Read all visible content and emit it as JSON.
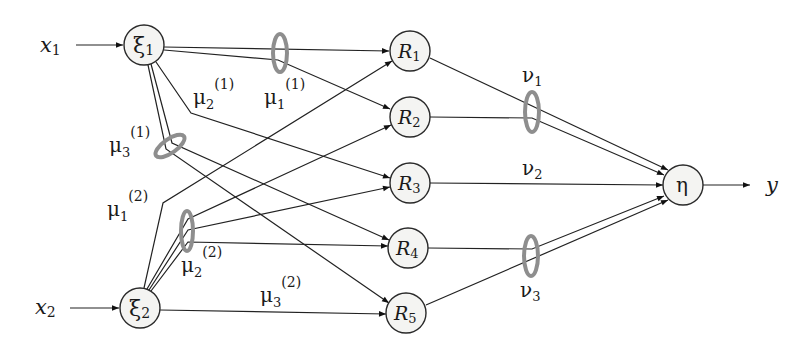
{
  "diagram": {
    "inputs": [
      {
        "id": "x1",
        "label": "x",
        "sub": "1"
      },
      {
        "id": "x2",
        "label": "x",
        "sub": "2"
      }
    ],
    "fuzzifiers": [
      {
        "id": "xi1",
        "label": "ξ",
        "sub": "1"
      },
      {
        "id": "xi2",
        "label": "ξ",
        "sub": "2"
      }
    ],
    "rules": [
      {
        "id": "R1",
        "label": "R",
        "sub": "1"
      },
      {
        "id": "R2",
        "label": "R",
        "sub": "2"
      },
      {
        "id": "R3",
        "label": "R",
        "sub": "3"
      },
      {
        "id": "R4",
        "label": "R",
        "sub": "4"
      },
      {
        "id": "R5",
        "label": "R",
        "sub": "5"
      }
    ],
    "output_node": {
      "id": "eta",
      "label": "η"
    },
    "output": {
      "label": "y"
    },
    "membership_labels": [
      {
        "id": "mu1_1",
        "label": "μ",
        "sub": "1",
        "sup": "(1)"
      },
      {
        "id": "mu2_1",
        "label": "μ",
        "sub": "2",
        "sup": "(1)"
      },
      {
        "id": "mu3_1",
        "label": "μ",
        "sub": "3",
        "sup": "(1)"
      },
      {
        "id": "mu1_2",
        "label": "μ",
        "sub": "1",
        "sup": "(2)"
      },
      {
        "id": "mu2_2",
        "label": "μ",
        "sub": "2",
        "sup": "(2)"
      },
      {
        "id": "mu3_2",
        "label": "μ",
        "sub": "3",
        "sup": "(2)"
      }
    ],
    "consequent_labels": [
      {
        "id": "nu1",
        "label": "ν",
        "sub": "1"
      },
      {
        "id": "nu2",
        "label": "ν",
        "sub": "2"
      },
      {
        "id": "nu3",
        "label": "ν",
        "sub": "3"
      }
    ],
    "edges": [
      [
        "x1",
        "xi1"
      ],
      [
        "x2",
        "xi2"
      ],
      [
        "xi1",
        "R1"
      ],
      [
        "xi1",
        "R2"
      ],
      [
        "xi1",
        "R3"
      ],
      [
        "xi1",
        "R4"
      ],
      [
        "xi1",
        "R5"
      ],
      [
        "xi2",
        "R1"
      ],
      [
        "xi2",
        "R2"
      ],
      [
        "xi2",
        "R3"
      ],
      [
        "xi2",
        "R4"
      ],
      [
        "xi2",
        "R5"
      ],
      [
        "R1",
        "eta"
      ],
      [
        "R2",
        "eta"
      ],
      [
        "R3",
        "eta"
      ],
      [
        "R4",
        "eta"
      ],
      [
        "R5",
        "eta"
      ],
      [
        "eta",
        "y"
      ]
    ],
    "colors": {
      "ring": "#8e8e8e",
      "node_fill": "#f4f4f2",
      "stroke": "#222222"
    }
  }
}
